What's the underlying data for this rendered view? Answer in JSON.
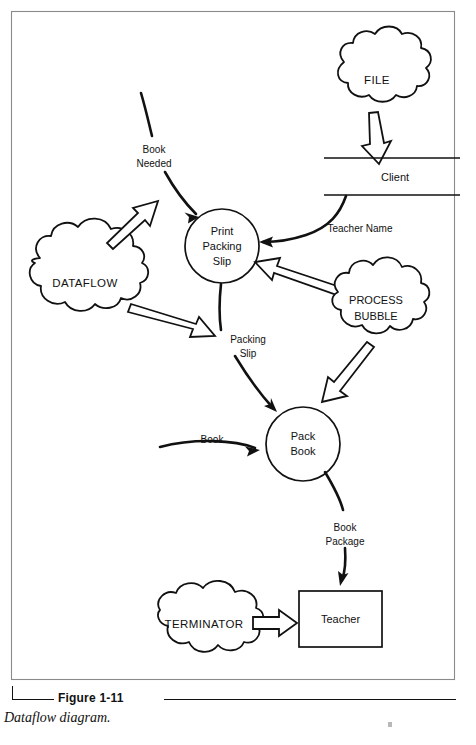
{
  "figure": {
    "number": "Figure 1-11",
    "title": "Dataflow diagram."
  },
  "diagram": {
    "kind": "dataflow-diagram",
    "nodes": [
      {
        "id": "file",
        "type": "cloud",
        "label": "FILE",
        "cx": 377,
        "cy": 80,
        "rx": 50,
        "ry": 36
      },
      {
        "id": "client",
        "type": "datastore",
        "label": "Client",
        "cx": 392,
        "cy": 177,
        "w": 136
      },
      {
        "id": "print-packing",
        "type": "process",
        "label_line1": "Print",
        "label_line2": "Packing",
        "label_line3": "Slip",
        "cx": 222,
        "cy": 246,
        "r": 37
      },
      {
        "id": "dataflow",
        "type": "cloud",
        "label": "DATAFLOW",
        "cx": 85,
        "cy": 283,
        "rx": 58,
        "ry": 43
      },
      {
        "id": "process-bubble",
        "type": "cloud",
        "label_line1": "PROCESS",
        "label_line2": "BUBBLE",
        "cx": 376,
        "cy": 308,
        "rx": 50,
        "ry": 41
      },
      {
        "id": "pack-book",
        "type": "process",
        "label_line1": "Pack",
        "label_line2": "Book",
        "cx": 303,
        "cy": 444,
        "r": 37
      },
      {
        "id": "terminator",
        "type": "cloud",
        "label": "TERMINATOR",
        "cx": 204,
        "cy": 625,
        "rx": 52,
        "ry": 34
      },
      {
        "id": "teacher",
        "type": "external",
        "label": "Teacher",
        "x": 299,
        "y": 591,
        "w": 83,
        "h": 56
      }
    ],
    "flows": [
      {
        "id": "book-needed",
        "label_line1": "Book",
        "label_line2": "Needed",
        "label_x": 154,
        "label_y": 155,
        "from": "offpage",
        "to": "print-packing"
      },
      {
        "id": "teacher-name",
        "label": "Teacher Name",
        "label_x": 360,
        "label_y": 229,
        "from": "client",
        "to": "print-packing"
      },
      {
        "id": "packing-slip",
        "label_line1": "Packing",
        "label_line2": "Slip",
        "label_x": 248,
        "label_y": 345,
        "from": "print-packing",
        "to": "pack-book"
      },
      {
        "id": "book",
        "label": "Book",
        "label_x": 212,
        "label_y": 440,
        "from": "offpage",
        "to": "pack-book"
      },
      {
        "id": "book-package",
        "label_line1": "Book",
        "label_line2": "Package",
        "label_x": 345,
        "label_y": 533,
        "from": "pack-book",
        "to": "teacher"
      }
    ],
    "annotation_arrows": [
      {
        "id": "file-to-client",
        "style": "hollow",
        "from": "file",
        "to": "client"
      },
      {
        "id": "dataflow-to-flow",
        "style": "hollow",
        "from": "dataflow",
        "to": "book-needed-flow"
      },
      {
        "id": "dataflow-to-process",
        "style": "hollow",
        "from": "dataflow",
        "to": "packing-slip-flow"
      },
      {
        "id": "bubble-to-print",
        "style": "hollow",
        "from": "process-bubble",
        "to": "print-packing"
      },
      {
        "id": "bubble-to-pack",
        "style": "hollow",
        "from": "process-bubble",
        "to": "pack-book"
      },
      {
        "id": "terminator-to-teacher",
        "style": "hollow",
        "from": "terminator",
        "to": "teacher"
      }
    ],
    "colors": {
      "ink": "#111111",
      "paper": "#ffffff",
      "frame": "#8a8a8a"
    }
  }
}
